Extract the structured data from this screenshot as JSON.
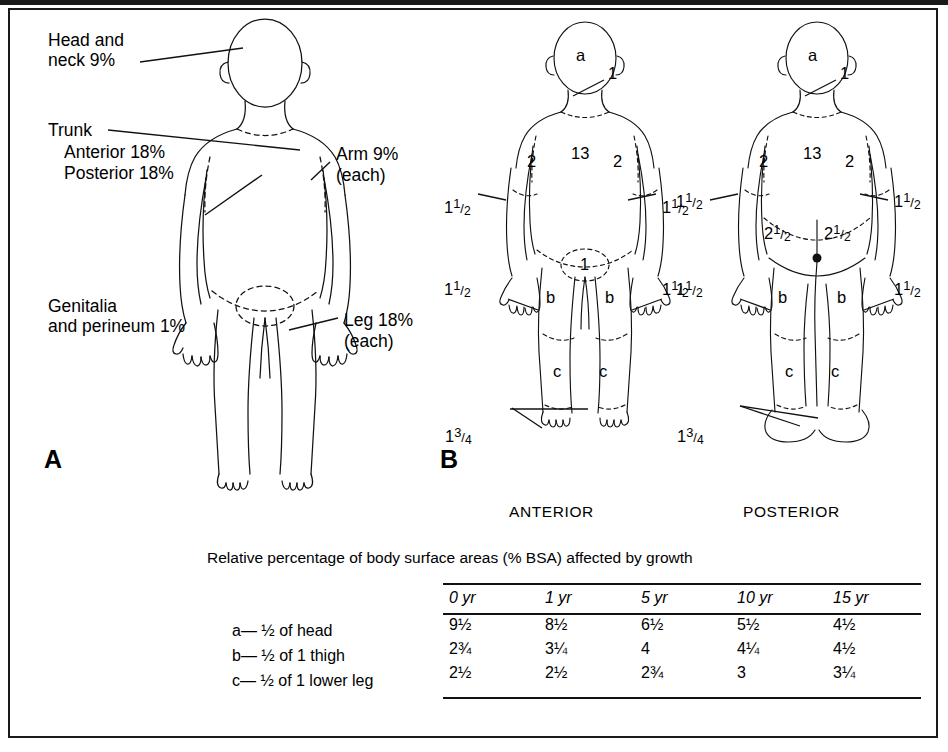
{
  "figure": {
    "panels": [
      {
        "letter": "A"
      },
      {
        "letter": "B"
      }
    ]
  },
  "panel_a": {
    "labels": {
      "head": "Head and\nneck 9%",
      "trunk": "Trunk",
      "trunk_anterior": "Anterior 18%",
      "trunk_posterior": "Posterior 18%",
      "arm": "Arm 9%",
      "arm_each": "(each)",
      "genitalia": "Genitalia\nand perineum 1%",
      "leg": "Leg 18%",
      "leg_each": "(each)"
    }
  },
  "panel_b": {
    "anterior": {
      "view_label": "ANTERIOR",
      "head": "a",
      "neck": "1",
      "trunk": "13",
      "upper_arm_left": "2",
      "upper_arm_right": "2",
      "forearm_left": "1",
      "forearm_left_frac": "1/2",
      "forearm_right": "1",
      "forearm_right_frac": "1/2",
      "hand_left": "1",
      "hand_left_frac": "1/2",
      "hand_right": "1",
      "hand_right_frac": "1/2",
      "genitalia": "1",
      "thigh_left": "b",
      "thigh_right": "b",
      "lower_leg_left": "c",
      "lower_leg_right": "c",
      "foot": "1",
      "foot_frac": "3/4"
    },
    "posterior": {
      "view_label": "POSTERIOR",
      "head": "a",
      "neck": "1",
      "trunk": "13",
      "upper_arm_left": "2",
      "upper_arm_right": "2",
      "forearm_left": "1",
      "forearm_left_frac": "1/2",
      "forearm_right": "1",
      "forearm_right_frac": "1/2",
      "hand_left": "1",
      "hand_left_frac": "1/2",
      "hand_right": "1",
      "hand_right_frac": "1/2",
      "buttock_left": "2",
      "buttock_left_frac": "1/2",
      "buttock_right": "2",
      "buttock_right_frac": "1/2",
      "thigh_left": "b",
      "thigh_right": "b",
      "lower_leg_left": "c",
      "lower_leg_right": "c",
      "foot": "1",
      "foot_frac": "3/4"
    }
  },
  "table": {
    "caption": "Relative percentage of body surface areas (% BSA) affected by growth",
    "columns": [
      "0 yr",
      "1 yr",
      "5 yr",
      "10 yr",
      "15 yr"
    ],
    "row_labels": [
      {
        "key": "a",
        "text": "a— ½ of head"
      },
      {
        "key": "b",
        "text": "b— ½ of 1 thigh"
      },
      {
        "key": "c",
        "text": "c— ½ of 1 lower leg"
      }
    ],
    "rows": [
      {
        "key": "a",
        "values": [
          "9½",
          "8½",
          "6½",
          "5½",
          "4½"
        ]
      },
      {
        "key": "b",
        "values": [
          "2¾",
          "3¼",
          "4",
          "4¼",
          "4½"
        ]
      },
      {
        "key": "c",
        "values": [
          "2½",
          "2½",
          "2¾",
          "3",
          "3¼"
        ]
      }
    ]
  },
  "colors": {
    "ink": "#111111",
    "frame": "#1a1a1a",
    "background": "#ffffff"
  }
}
